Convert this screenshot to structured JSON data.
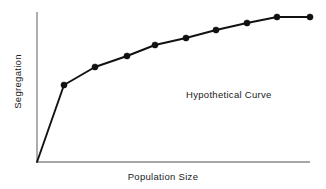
{
  "chart_data": {
    "type": "line",
    "title": "",
    "xlabel": "Population Size",
    "ylabel": "Segregation",
    "annotations": [
      {
        "text": "Hypothetical Curve",
        "x_frac": 0.57,
        "y_frac": 0.47
      }
    ],
    "grid": false,
    "legend": null,
    "xlim": [
      0,
      10
    ],
    "ylim": [
      0,
      10
    ],
    "axis_ticks": {
      "x": [],
      "y": []
    },
    "series": [
      {
        "name": "Hypothetical Curve",
        "marker": "filled-circle",
        "color": "#111111",
        "x": [
          0.0,
          1.0,
          2.1,
          3.3,
          4.3,
          5.4,
          6.5,
          7.6,
          8.7,
          9.8,
          10.0
        ],
        "y": [
          0.0,
          5.1,
          6.3,
          7.1,
          7.8,
          8.3,
          8.8,
          9.2,
          9.6,
          9.7,
          9.7
        ],
        "points_px": [
          [
            37,
            162
          ],
          [
            64,
            85
          ],
          [
            95,
            67
          ],
          [
            127,
            56
          ],
          [
            155,
            45
          ],
          [
            186,
            38
          ],
          [
            216,
            30
          ],
          [
            247,
            23
          ],
          [
            277,
            17
          ],
          [
            310,
            17
          ]
        ]
      }
    ]
  },
  "figure": {
    "width": 326,
    "height": 189,
    "background": "#ffffff",
    "axis_color": "#8a8a8a",
    "line_color": "#111111",
    "text_color": "#1a1a1a",
    "plot_box_px": {
      "left": 37,
      "top": 12,
      "right": 310,
      "bottom": 162
    }
  }
}
